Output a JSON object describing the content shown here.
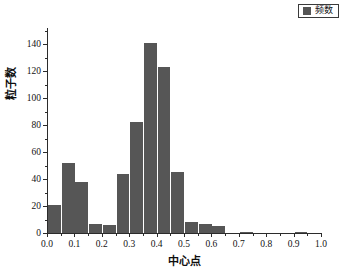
{
  "legend": {
    "entries": [
      {
        "label": "频数",
        "color": "#555555",
        "marker": "square-swatch"
      }
    ],
    "position": "top-right",
    "border": true
  },
  "axes": {
    "x": {
      "label": "中心点",
      "ticks": [
        "0.0",
        "0.1",
        "0.2",
        "0.3",
        "0.4",
        "0.5",
        "0.6",
        "0.7",
        "0.8",
        "0.9",
        "1.0"
      ],
      "min": 0.0,
      "max": 1.0,
      "minor_ticks_per_interval": 1
    },
    "y": {
      "label": "粒子数",
      "ticks": [
        "0",
        "20",
        "40",
        "60",
        "80",
        "100",
        "120",
        "140"
      ],
      "min": 0,
      "max": 152,
      "minor_ticks_per_interval": 1
    }
  },
  "chart_data": {
    "type": "bar",
    "title": "",
    "subtitle": "",
    "xlabel": "中心点",
    "ylabel": "粒子数",
    "xlim": [
      0.0,
      1.0
    ],
    "ylim": [
      0,
      152
    ],
    "grid": false,
    "legend_position": "top-right",
    "bar_color": "#565656",
    "bin_width": 0.05,
    "categories": [
      "0.00",
      "0.05",
      "0.10",
      "0.15",
      "0.20",
      "0.25",
      "0.30",
      "0.35",
      "0.40",
      "0.45",
      "0.50",
      "0.55",
      "0.60",
      "0.65",
      "0.70",
      "0.75",
      "0.80",
      "0.85",
      "0.90",
      "0.95"
    ],
    "series": [
      {
        "name": "频数",
        "values": [
          21,
          52,
          38,
          7,
          6,
          44,
          82,
          141,
          123,
          45,
          8,
          7,
          5,
          0,
          1,
          0,
          0,
          0,
          1,
          0
        ]
      }
    ]
  }
}
